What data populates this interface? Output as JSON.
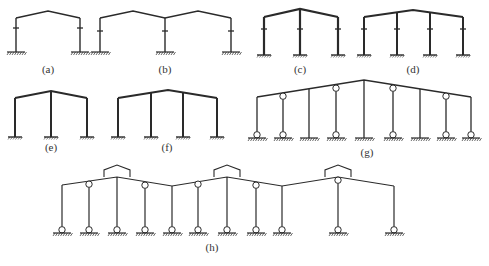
{
  "colors": {
    "line": "#2a2a2a",
    "background": "#ffffff",
    "label": "#333333"
  },
  "frames": [
    {
      "id": "a",
      "label": "(a)",
      "label_pos": [
        48,
        73
      ],
      "type": "fixed",
      "stroke": 1.4,
      "roof": [
        [
          16,
          18
        ],
        [
          48,
          11
        ],
        [
          80,
          18
        ]
      ],
      "columns": [
        {
          "x": 16,
          "top": 18,
          "base": 52,
          "knee": 28
        },
        {
          "x": 80,
          "top": 18,
          "base": 52,
          "knee": 28
        }
      ]
    },
    {
      "id": "b",
      "label": "(b)",
      "label_pos": [
        165,
        73
      ],
      "type": "fixed",
      "stroke": 1.4,
      "roof": [
        [
          100,
          18
        ],
        [
          133,
          11
        ],
        [
          165,
          18
        ],
        [
          198,
          11
        ],
        [
          231,
          18
        ]
      ],
      "columns": [
        {
          "x": 100,
          "top": 18,
          "base": 52,
          "knee": 31
        },
        {
          "x": 165,
          "top": 18,
          "base": 52,
          "knee": 31
        },
        {
          "x": 231,
          "top": 18,
          "base": 52,
          "knee": 31
        }
      ]
    },
    {
      "id": "c",
      "label": "(c)",
      "label_pos": [
        300,
        73
      ],
      "type": "fixed-bold",
      "stroke": 2.2,
      "roof": [
        [
          264,
          17
        ],
        [
          300,
          9
        ],
        [
          338,
          17
        ]
      ],
      "columns": [
        {
          "x": 264,
          "top": 17,
          "base": 55,
          "knee": 29
        },
        {
          "x": 300,
          "top": 9,
          "base": 55,
          "knee": 29
        },
        {
          "x": 338,
          "top": 17,
          "base": 55,
          "knee": 29
        }
      ]
    },
    {
      "id": "d",
      "label": "(d)",
      "label_pos": [
        413,
        73
      ],
      "type": "fixed-bold",
      "stroke": 2.0,
      "roof": [
        [
          364,
          17
        ],
        [
          413,
          10
        ],
        [
          463,
          17
        ]
      ],
      "columns": [
        {
          "x": 364,
          "top": 17,
          "base": 55,
          "knee": 29
        },
        {
          "x": 397,
          "top": 12,
          "base": 55,
          "knee": 29
        },
        {
          "x": 430,
          "top": 12,
          "base": 55,
          "knee": 29
        },
        {
          "x": 463,
          "top": 17,
          "base": 55,
          "knee": 29
        }
      ]
    },
    {
      "id": "e",
      "label": "(e)",
      "label_pos": [
        51,
        151
      ],
      "type": "fixed-plain",
      "stroke": 2.0,
      "roof": [
        [
          15,
          98
        ],
        [
          51,
          91
        ],
        [
          87,
          98
        ]
      ],
      "columns": [
        {
          "x": 15,
          "top": 98,
          "base": 137
        },
        {
          "x": 51,
          "top": 91,
          "base": 137
        },
        {
          "x": 87,
          "top": 98,
          "base": 137
        }
      ]
    },
    {
      "id": "f",
      "label": "(f)",
      "label_pos": [
        167,
        151
      ],
      "type": "fixed-plain",
      "stroke": 2.0,
      "roof": [
        [
          118,
          98
        ],
        [
          168,
          90
        ],
        [
          217,
          98
        ]
      ],
      "columns": [
        {
          "x": 118,
          "top": 98,
          "base": 137
        },
        {
          "x": 151,
          "top": 93,
          "base": 137
        },
        {
          "x": 183,
          "top": 93,
          "base": 137
        },
        {
          "x": 217,
          "top": 98,
          "base": 137
        }
      ]
    },
    {
      "id": "g",
      "label": "(g)",
      "label_pos": [
        367,
        156
      ],
      "type": "mixed",
      "stroke": 1.3,
      "roof": [
        [
          257,
          97
        ],
        [
          364,
          80
        ],
        [
          471,
          97
        ]
      ],
      "columns": [
        {
          "x": 257,
          "top": 97,
          "base": 138,
          "top_hinge": false,
          "base_hinge": true
        },
        {
          "x": 283,
          "top": 93,
          "base": 138,
          "top_hinge": true,
          "base_hinge": true
        },
        {
          "x": 309,
          "top": 89,
          "base": 138,
          "top_hinge": false,
          "base_hinge": false
        },
        {
          "x": 336,
          "top": 85,
          "base": 138,
          "top_hinge": true,
          "base_hinge": true
        },
        {
          "x": 364,
          "top": 80,
          "base": 138,
          "top_hinge": false,
          "base_hinge": false
        },
        {
          "x": 393,
          "top": 85,
          "base": 138,
          "top_hinge": true,
          "base_hinge": true
        },
        {
          "x": 420,
          "top": 89,
          "base": 138,
          "top_hinge": false,
          "base_hinge": false
        },
        {
          "x": 446,
          "top": 93,
          "base": 138,
          "top_hinge": true,
          "base_hinge": true
        },
        {
          "x": 471,
          "top": 97,
          "base": 138,
          "top_hinge": false,
          "base_hinge": true
        }
      ]
    },
    {
      "id": "h",
      "label": "(h)",
      "label_pos": [
        212,
        251
      ],
      "type": "hinged-monitor",
      "stroke": 1.2,
      "roof": [
        [
          62,
          185
        ],
        [
          117,
          177
        ],
        [
          172,
          186
        ],
        [
          227,
          177
        ],
        [
          282,
          186
        ],
        [
          338,
          177
        ],
        [
          394,
          186
        ]
      ],
      "monitors": [
        {
          "x1": 104,
          "x2": 130,
          "base": 177,
          "wall": 170,
          "peak": 165
        },
        {
          "x1": 214,
          "x2": 240,
          "base": 177,
          "wall": 170,
          "peak": 165
        },
        {
          "x1": 325,
          "x2": 351,
          "base": 177,
          "wall": 170,
          "peak": 165
        }
      ],
      "columns": [
        {
          "x": 62,
          "top": 185,
          "base": 233,
          "top_hinge": false,
          "base_hinge": true
        },
        {
          "x": 89,
          "top": 181,
          "base": 233,
          "top_hinge": true,
          "base_hinge": true
        },
        {
          "x": 117,
          "top": 177,
          "base": 233,
          "top_hinge": false,
          "base_hinge": true
        },
        {
          "x": 145,
          "top": 182,
          "base": 233,
          "top_hinge": true,
          "base_hinge": true
        },
        {
          "x": 172,
          "top": 186,
          "base": 233,
          "top_hinge": false,
          "base_hinge": true
        },
        {
          "x": 198,
          "top": 181,
          "base": 233,
          "top_hinge": true,
          "base_hinge": true
        },
        {
          "x": 227,
          "top": 177,
          "base": 233,
          "top_hinge": false,
          "base_hinge": true
        },
        {
          "x": 256,
          "top": 182,
          "base": 233,
          "top_hinge": true,
          "base_hinge": true
        },
        {
          "x": 282,
          "top": 186,
          "base": 233,
          "top_hinge": false,
          "base_hinge": true
        },
        {
          "x": 338,
          "top": 177,
          "base": 233,
          "top_hinge": true,
          "base_hinge": true
        },
        {
          "x": 394,
          "top": 186,
          "base": 233,
          "top_hinge": false,
          "base_hinge": true
        }
      ]
    }
  ]
}
